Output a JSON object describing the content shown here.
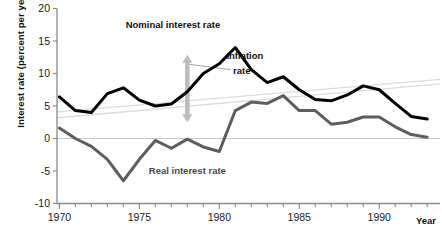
{
  "chart_data": {
    "type": "line",
    "title": "",
    "xlabel": "Year",
    "ylabel": "Interest rate (percent per year)",
    "xlim": [
      1969.85,
      1993.8
    ],
    "ylim": [
      -10,
      20
    ],
    "ytick_values": [
      20,
      15,
      10,
      5,
      0,
      -5,
      -10
    ],
    "ytick_labels": [
      "20",
      "15",
      "10",
      "5",
      "0",
      "-5",
      "-10"
    ],
    "xtick_labels": [
      "1970",
      "1975",
      "1980",
      "1985",
      "1990"
    ],
    "xtick_values": [
      1970,
      1975,
      1980,
      1985,
      1990
    ],
    "xminor_step": 1,
    "grid": false,
    "zero_line": 0,
    "legend": "inline-labels",
    "series": [
      {
        "name": "Nominal interest rate",
        "color": "#000000",
        "width": 3.0,
        "x": [
          1970,
          1971,
          1972,
          1973,
          1974,
          1975,
          1976,
          1977,
          1978,
          1979,
          1980,
          1981,
          1982,
          1983,
          1984,
          1985,
          1986,
          1987,
          1988,
          1989,
          1990,
          1991,
          1992,
          1993
        ],
        "values": [
          6.4,
          4.3,
          4.0,
          6.9,
          7.8,
          5.9,
          5.0,
          5.3,
          7.2,
          10.0,
          11.5,
          14.0,
          10.6,
          8.6,
          9.5,
          7.5,
          6.0,
          5.8,
          6.7,
          8.1,
          7.5,
          5.4,
          3.4,
          3.0
        ]
      },
      {
        "name": "Real interest rate",
        "color": "#5e5e5e",
        "width": 3.0,
        "x": [
          1970,
          1971,
          1972,
          1973,
          1974,
          1975,
          1976,
          1977,
          1978,
          1979,
          1980,
          1981,
          1982,
          1983,
          1984,
          1985,
          1986,
          1987,
          1988,
          1989,
          1990,
          1991,
          1992,
          1993
        ],
        "values": [
          1.6,
          0.0,
          -1.2,
          -3.2,
          -6.5,
          -3.2,
          -0.3,
          -1.5,
          -0.1,
          -1.3,
          -2.0,
          4.3,
          5.6,
          5.4,
          6.6,
          4.3,
          4.3,
          2.2,
          2.5,
          3.3,
          3.3,
          1.8,
          0.6,
          0.2
        ]
      }
    ],
    "trend_lines": [
      {
        "name": "faint-trend-upper",
        "color": "#dcdcdc",
        "x0": 1969.9,
        "y0": 4.1,
        "x1": 1993.8,
        "y1": 9.1
      },
      {
        "name": "faint-trend-lower",
        "color": "#dcdcdc",
        "x0": 1969.9,
        "y0": 3.2,
        "x1": 1993.8,
        "y1": 8.4
      }
    ],
    "annotations": [
      {
        "name": "nominal-series-label",
        "text": "Nominal interest rate",
        "x": 1977.1,
        "y": 17.0,
        "color": "#111111"
      },
      {
        "name": "real-series-label",
        "text": "Real interest rate",
        "x": 1978.0,
        "y": -5.4,
        "color": "#4a4a4a"
      },
      {
        "name": "inflation-rate-label-line1",
        "text": "Inflation",
        "x": 1981.6,
        "y": 12.3,
        "color": "#111111"
      },
      {
        "name": "inflation-rate-label-line2",
        "text": "rate",
        "x": 1981.4,
        "y": 10.0,
        "color": "#111111"
      }
    ],
    "arrow": {
      "name": "inflation-rate-arrow",
      "color": "#bdbdbd",
      "x": 1978.0,
      "y_top": 12.9,
      "y_bottom": 2.5,
      "description": "double-headed vertical arrow spanning gap between nominal and real lines"
    }
  }
}
